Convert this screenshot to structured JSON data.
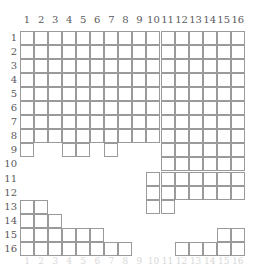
{
  "figure": {
    "kind": "grid-diagram",
    "title": "",
    "rows": 16,
    "cols": 16,
    "grid_line_color": "#9a9a9a",
    "label_color": "#59595c",
    "background": "#ffffff"
  },
  "axes": {
    "column_labels": [
      "1",
      "2",
      "3",
      "4",
      "5",
      "6",
      "7",
      "8",
      "9",
      "10",
      "11",
      "12",
      "13",
      "14",
      "15",
      "16"
    ],
    "row_labels": [
      "1",
      "2",
      "3",
      "4",
      "5",
      "6",
      "7",
      "8",
      "9",
      "10",
      "11",
      "12",
      "13",
      "14",
      "15",
      "16"
    ]
  },
  "chart_data": {
    "type": "heatmap",
    "title": "",
    "xlabel": "",
    "ylabel": "",
    "categories": [
      "1",
      "2",
      "3",
      "4",
      "5",
      "6",
      "7",
      "8",
      "9",
      "10",
      "11",
      "12",
      "13",
      "14",
      "15",
      "16"
    ],
    "row_categories": [
      "1",
      "2",
      "3",
      "4",
      "5",
      "6",
      "7",
      "8",
      "9",
      "10",
      "11",
      "12",
      "13",
      "14",
      "15",
      "16"
    ],
    "grid": true,
    "legend": "none",
    "note": "Each entry lists the 1-based column indices that are drawn as outlined cells on that row.",
    "filled_cells_by_row": {
      "1": [
        1,
        2,
        3,
        4,
        5,
        6,
        7,
        8,
        9,
        10,
        11,
        12,
        13,
        14,
        15,
        16
      ],
      "2": [
        1,
        2,
        3,
        4,
        5,
        6,
        7,
        8,
        9,
        10,
        11,
        12,
        13,
        14,
        15,
        16
      ],
      "3": [
        1,
        2,
        3,
        4,
        5,
        6,
        7,
        8,
        9,
        10,
        11,
        12,
        13,
        14,
        15,
        16
      ],
      "4": [
        1,
        2,
        3,
        4,
        5,
        6,
        7,
        8,
        9,
        10,
        11,
        12,
        13,
        14,
        15,
        16
      ],
      "5": [
        1,
        2,
        3,
        4,
        5,
        6,
        7,
        8,
        9,
        10,
        11,
        12,
        13,
        14,
        15,
        16
      ],
      "6": [
        1,
        2,
        3,
        4,
        5,
        6,
        7,
        8,
        9,
        10,
        11,
        12,
        13,
        14,
        15,
        16
      ],
      "7": [
        1,
        2,
        3,
        4,
        5,
        6,
        7,
        8,
        9,
        10,
        11,
        12,
        13,
        14,
        15,
        16
      ],
      "8": [
        1,
        2,
        3,
        4,
        5,
        6,
        7,
        8,
        9,
        10,
        11,
        12,
        13,
        14,
        15,
        16
      ],
      "9": [
        1,
        4,
        5,
        7,
        11,
        12,
        13,
        14,
        15,
        16
      ],
      "10": [
        11,
        12,
        13,
        14,
        15,
        16
      ],
      "11": [
        10,
        11,
        12,
        13,
        14,
        15,
        16
      ],
      "12": [
        10,
        11,
        12,
        13,
        14,
        15,
        16
      ],
      "13": [
        1,
        2,
        10,
        11
      ],
      "14": [
        1,
        2,
        3
      ],
      "15": [
        1,
        2,
        3,
        4,
        5,
        6,
        15,
        16
      ],
      "16": [
        1,
        2,
        3,
        4,
        5,
        6,
        7,
        8,
        12,
        13,
        14,
        15,
        16
      ]
    },
    "column_counts": [
      12,
      12,
      11,
      11,
      10,
      10,
      9,
      9,
      8,
      12,
      14,
      13,
      13,
      13,
      14,
      14
    ],
    "row_counts": [
      16,
      16,
      16,
      16,
      16,
      16,
      16,
      16,
      10,
      6,
      7,
      7,
      4,
      3,
      8,
      13
    ]
  }
}
